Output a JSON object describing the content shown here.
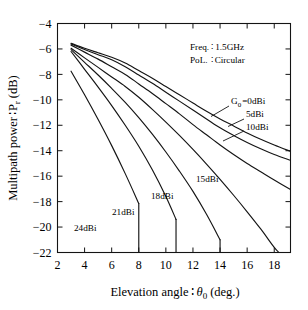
{
  "chart_data": {
    "type": "line",
    "title": "",
    "xlabel": "Elevation angle : θ0 (deg.)",
    "ylabel": "Multipath power : Pr (dB)",
    "xlim": [
      2,
      19.2
    ],
    "ylim": [
      -22,
      -4
    ],
    "xticks": [
      2,
      4,
      6,
      8,
      10,
      12,
      14,
      16,
      18
    ],
    "yticks": [
      -4,
      -6,
      -8,
      -10,
      -12,
      -14,
      -16,
      -18,
      -20,
      -22
    ],
    "grid": false,
    "legend_position": "inline-annotations",
    "annotations": [
      "Freq. : 1.5GHz",
      "PoL. : Circular"
    ],
    "series": [
      {
        "name": "G0=0dBi",
        "label": "G0 = 0dBi",
        "x": [
          3.0,
          4.0,
          5.0,
          6.0,
          7.0,
          8.0,
          9.0,
          10.0,
          11.0,
          12.0,
          13.0,
          14.0,
          15.0,
          16.0,
          17.0,
          18.0,
          19.2
        ],
        "y": [
          -5.55,
          -5.95,
          -6.3,
          -6.65,
          -7.1,
          -7.7,
          -8.3,
          -8.95,
          -9.6,
          -10.25,
          -10.9,
          -11.5,
          -12.05,
          -12.6,
          -13.1,
          -13.55,
          -14.05
        ]
      },
      {
        "name": "5dBi",
        "label": "5dBi",
        "x": [
          3.0,
          4.0,
          5.0,
          6.0,
          7.0,
          8.0,
          9.0,
          10.0,
          11.0,
          12.0,
          13.0,
          14.0,
          15.0,
          16.0,
          17.0,
          18.0,
          19.2
        ],
        "y": [
          -5.6,
          -6.05,
          -6.45,
          -6.85,
          -7.4,
          -8.05,
          -8.7,
          -9.4,
          -10.1,
          -10.8,
          -11.5,
          -12.2,
          -12.8,
          -13.35,
          -13.85,
          -14.3,
          -14.75
        ]
      },
      {
        "name": "10dBi",
        "label": "10dBi",
        "x": [
          3.0,
          4.0,
          5.0,
          6.0,
          7.0,
          8.0,
          9.0,
          10.0,
          11.0,
          12.0,
          13.0,
          14.0,
          15.0,
          16.0,
          17.0,
          18.0,
          19.2
        ],
        "y": [
          -5.7,
          -6.25,
          -6.8,
          -7.4,
          -8.0,
          -8.75,
          -9.5,
          -10.3,
          -11.1,
          -11.95,
          -12.75,
          -13.55,
          -14.3,
          -15.0,
          -15.65,
          -16.3,
          -17.05
        ]
      },
      {
        "name": "15dBi",
        "label": "15dBi",
        "x": [
          3.0,
          4.0,
          5.0,
          6.0,
          7.0,
          8.0,
          9.0,
          10.0,
          11.0,
          12.0,
          13.0,
          14.0,
          15.0,
          16.0,
          17.0,
          18.0,
          18.35
        ],
        "y": [
          -5.95,
          -6.7,
          -7.45,
          -8.2,
          -8.95,
          -9.8,
          -10.75,
          -11.75,
          -12.8,
          -13.9,
          -15.05,
          -16.25,
          -17.5,
          -18.8,
          -20.15,
          -21.6,
          -22.0
        ]
      },
      {
        "name": "18dBi",
        "label": "18dBi",
        "x": [
          3.0,
          4.0,
          5.0,
          6.0,
          7.0,
          8.0,
          9.0,
          10.0,
          11.0,
          12.0,
          13.0,
          14.0
        ],
        "y": [
          -6.05,
          -7.05,
          -8.05,
          -9.1,
          -10.2,
          -11.4,
          -12.7,
          -14.1,
          -15.6,
          -17.2,
          -19.0,
          -21.0
        ]
      },
      {
        "name": "21dBi",
        "label": "21dBi",
        "x": [
          3.0,
          4.0,
          5.0,
          6.0,
          7.0,
          8.0,
          9.0,
          10.0,
          10.75
        ],
        "y": [
          -6.2,
          -7.6,
          -9.0,
          -10.45,
          -12.0,
          -13.65,
          -15.5,
          -17.6,
          -19.4
        ]
      },
      {
        "name": "24dBi",
        "label": "24dBi",
        "x": [
          3.0,
          4.0,
          5.0,
          6.0,
          7.0,
          8.0
        ],
        "y": [
          -7.75,
          -9.6,
          -11.55,
          -13.6,
          -15.8,
          -18.15
        ]
      }
    ]
  },
  "axes": {
    "ylabel": "Multipath power",
    "ylabel_sep": "∶",
    "ylabel_sym": "P",
    "ylabel_sub": "r",
    "ylabel_unit": "(dB)",
    "xlabel": "Elevation angle",
    "xlabel_sep": "∶",
    "xlabel_sym": "θ",
    "xlabel_sub": "0",
    "xlabel_unit": "(deg.)",
    "ytick_labels": [
      "−4",
      "−6",
      "−8",
      "−10",
      "−12",
      "−14",
      "−16",
      "−18",
      "−20",
      "−22"
    ],
    "xtick_labels": [
      "2",
      "4",
      "6",
      "8",
      "10",
      "12",
      "14",
      "16",
      "18"
    ]
  },
  "annotations": {
    "freq_key": "Freq.",
    "freq_sep": "∶",
    "freq_val": "1.5GHz",
    "pol_key": "PoL.",
    "pol_sep": "∶",
    "pol_val": "Circular"
  },
  "curve_labels": {
    "g0_prefix": "G",
    "g0_sub": "0",
    "g0_rest": "=0dBi",
    "five": "5dBi",
    "ten": "10dBi",
    "fifteen": "15dBi",
    "eighteen": "18dBi",
    "twentyone": "21dBi",
    "twentyfour": "24dBi"
  },
  "colors": {
    "line": "#141414",
    "axis": "#141414",
    "background": "#ffffff"
  }
}
